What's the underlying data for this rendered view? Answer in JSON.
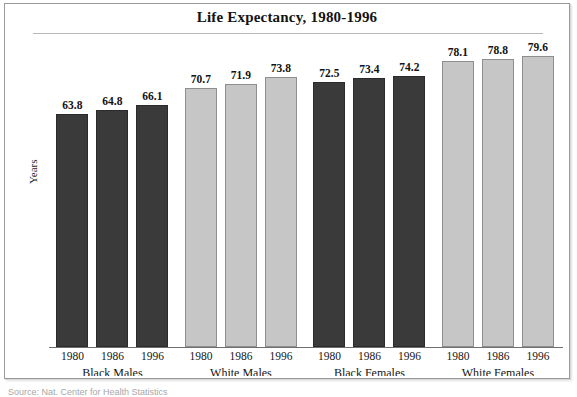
{
  "chart_data": {
    "type": "bar",
    "title": "Life Expectancy, 1980-1996",
    "xlabel": "",
    "ylabel": "Years",
    "ylim": [
      0,
      85
    ],
    "grid": false,
    "legend": "none",
    "categories": [
      "1980",
      "1986",
      "1996"
    ],
    "groups": [
      {
        "name": "Black Males",
        "color": "#3a3a3a",
        "shade": "dark",
        "values": [
          63.8,
          64.8,
          66.1
        ],
        "labels": [
          "63.8",
          "64.8",
          "66.1"
        ]
      },
      {
        "name": "White Males",
        "color": "#c6c6c6",
        "shade": "light",
        "values": [
          70.7,
          71.9,
          73.8
        ],
        "labels": [
          "70.7",
          "71.9",
          "73.8"
        ]
      },
      {
        "name": "Black Females",
        "color": "#3a3a3a",
        "shade": "dark",
        "values": [
          72.5,
          73.4,
          74.2
        ],
        "labels": [
          "72.5",
          "73.4",
          "74.2"
        ]
      },
      {
        "name": "White Females",
        "color": "#c6c6c6",
        "shade": "light",
        "values": [
          78.1,
          78.8,
          79.6
        ],
        "labels": [
          "78.1",
          "78.8",
          "79.6"
        ]
      }
    ]
  },
  "figure": {
    "title": "Life Expectancy, 1980-1996",
    "y_axis_label": "Years",
    "source_note": "Source: Nat. Center for Health Statistics"
  }
}
